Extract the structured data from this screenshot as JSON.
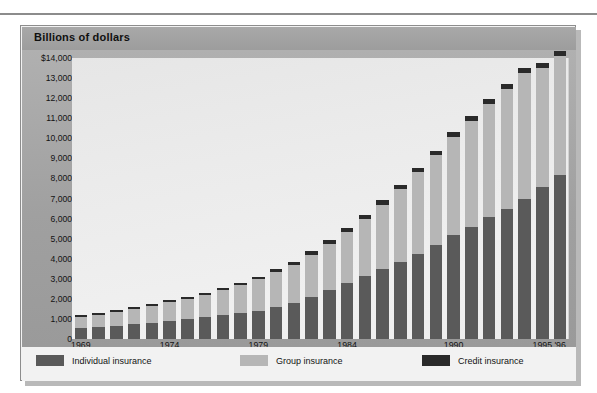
{
  "top_rule": {
    "visible": true
  },
  "panel": {
    "title": "Billions of dollars"
  },
  "legend": {
    "items": [
      {
        "label": "Individual insurance",
        "color": "#5a5a5a",
        "key": "individual"
      },
      {
        "label": "Group insurance",
        "color": "#b6b6b6",
        "key": "group"
      },
      {
        "label": "Credit insurance",
        "color": "#2a2a2a",
        "key": "credit"
      }
    ]
  },
  "chart_data": {
    "type": "bar",
    "stacked": true,
    "title": "Billions of dollars",
    "xlabel": "",
    "ylabel": "Billions of dollars",
    "ylim": [
      0,
      14000
    ],
    "grid": false,
    "legend_position": "bottom",
    "y_ticks": [
      {
        "value": 14000,
        "label": "$14,000"
      },
      {
        "value": 13000,
        "label": "13,000"
      },
      {
        "value": 12000,
        "label": "12,000"
      },
      {
        "value": 11000,
        "label": "11,000"
      },
      {
        "value": 10000,
        "label": "10,000"
      },
      {
        "value": 9000,
        "label": "9,000"
      },
      {
        "value": 8000,
        "label": "8,000"
      },
      {
        "value": 7000,
        "label": "7,000"
      },
      {
        "value": 6000,
        "label": "6,000"
      },
      {
        "value": 5000,
        "label": "5,000"
      },
      {
        "value": 4000,
        "label": "4,000"
      },
      {
        "value": 3000,
        "label": "3,000"
      },
      {
        "value": 2000,
        "label": "2,000"
      },
      {
        "value": 1000,
        "label": "1,000"
      },
      {
        "value": 0,
        "label": "0"
      }
    ],
    "x_tick_labels": [
      {
        "index": 0,
        "label": "1969"
      },
      {
        "index": 5,
        "label": "1974"
      },
      {
        "index": 10,
        "label": "1979"
      },
      {
        "index": 15,
        "label": "1984"
      },
      {
        "index": 21,
        "label": "1990"
      },
      {
        "index": 26,
        "label": "1995"
      },
      {
        "index": 27,
        "label": "'96"
      }
    ],
    "categories": [
      "1969",
      "1970",
      "1971",
      "1972",
      "1973",
      "1974",
      "1975",
      "1976",
      "1977",
      "1978",
      "1979",
      "1980",
      "1981",
      "1982",
      "1983",
      "1984",
      "1985",
      "1986",
      "1987",
      "1988",
      "1989",
      "1990",
      "1991",
      "1992",
      "1993",
      "1994",
      "1995",
      "1996"
    ],
    "series": [
      {
        "name": "Individual insurance",
        "color": "#5a5a5a",
        "values": [
          540,
          600,
          660,
          730,
          800,
          900,
          990,
          1080,
          1180,
          1290,
          1420,
          1600,
          1800,
          2100,
          2450,
          2800,
          3150,
          3500,
          3850,
          4250,
          4700,
          5200,
          5600,
          6100,
          6500,
          7000,
          7550,
          8150
        ]
      },
      {
        "name": "Group insurance",
        "color": "#b6b6b6",
        "values": [
          560,
          620,
          680,
          750,
          830,
          930,
          1010,
          1120,
          1240,
          1380,
          1550,
          1720,
          1900,
          2100,
          2300,
          2550,
          2850,
          3200,
          3600,
          4050,
          4450,
          4850,
          5250,
          5600,
          5950,
          6250,
          5950,
          5950
        ]
      },
      {
        "name": "Credit insurance",
        "color": "#2a2a2a",
        "values": [
          80,
          90,
          95,
          100,
          105,
          110,
          110,
          115,
          120,
          130,
          140,
          150,
          160,
          170,
          180,
          190,
          200,
          210,
          220,
          230,
          240,
          250,
          250,
          250,
          250,
          250,
          250,
          250
        ]
      }
    ],
    "totals": [
      1180,
      1310,
      1435,
      1580,
      1735,
      1940,
      2110,
      2315,
      2540,
      2800,
      3110,
      3470,
      3860,
      4370,
      4930,
      5540,
      6200,
      6910,
      7670,
      8530,
      9390,
      10300,
      11100,
      11950,
      12700,
      13500,
      13750,
      14350
    ]
  }
}
